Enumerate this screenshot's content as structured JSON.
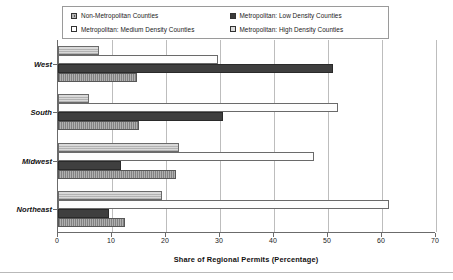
{
  "chart_data": {
    "type": "bar",
    "orientation": "horizontal",
    "title": "",
    "xlabel": "Share of Regional Permits (Percentage)",
    "ylabel": "",
    "xlim": [
      0,
      70
    ],
    "xticks": [
      0,
      10,
      20,
      30,
      40,
      50,
      60,
      70
    ],
    "xtick_labels": [
      "0",
      "10",
      "20",
      "30",
      "40",
      "50",
      "60",
      "70"
    ],
    "grid": true,
    "grid_axis": "x",
    "legend_position": "top",
    "categories": [
      "West",
      "South",
      "Midwest",
      "Northeast"
    ],
    "series": [
      {
        "name": "Non-Metropolitan Counties",
        "swatch": "sw-nonmetro",
        "color": "#b0b0b0",
        "values": [
          14.6,
          15.0,
          21.8,
          12.4
        ]
      },
      {
        "name": "Metropolitan: Low Density Counties",
        "swatch": "sw-low",
        "color": "#3f3f3f",
        "values": [
          51.0,
          30.5,
          11.7,
          9.5
        ]
      },
      {
        "name": "Metropolitan: Medium Density Counties",
        "swatch": "sw-medium",
        "color": "#fdfdfd",
        "values": [
          29.6,
          51.8,
          47.4,
          61.3
        ]
      },
      {
        "name": "Metropolitan: High Density Counties",
        "swatch": "sw-high",
        "color": "#d9d9d9",
        "values": [
          7.6,
          5.7,
          22.4,
          19.3
        ]
      }
    ]
  },
  "legend": {
    "entries": [
      {
        "label": "Non-Metropolitan Counties",
        "swatch": "sw-nonmetro"
      },
      {
        "label": "Metropolitan: Low Density Counties",
        "swatch": "sw-low"
      },
      {
        "label": "Metropolitan: Medium Density Counties",
        "swatch": "sw-medium"
      },
      {
        "label": "Metropolitan: High Density Counties",
        "swatch": "sw-high"
      }
    ]
  }
}
